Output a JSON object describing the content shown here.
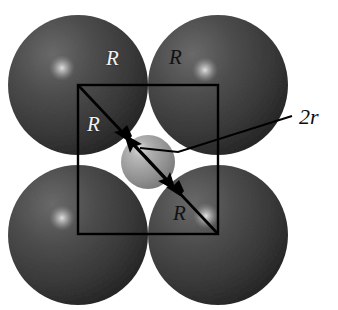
{
  "figure": {
    "type": "scientific-diagram",
    "canvas": {
      "width": 338,
      "height": 310,
      "background": "#ffffff"
    }
  },
  "colors": {
    "large_sphere_base": "#4a4a4a",
    "large_sphere_dark": "#2a2a2a",
    "large_sphere_highlight": "#d8d8d8",
    "small_sphere_base": "#9d9d9d",
    "small_sphere_dark": "#7a7a7a",
    "small_sphere_highlight": "#dcdcdc",
    "line": "#000000",
    "label_light": "#f2f2f2",
    "label_dark": "#121212",
    "background": "#ffffff"
  },
  "spheres": {
    "large": [
      {
        "name": "sphere-top-left",
        "cx": 78,
        "cy": 85,
        "r": 70,
        "hx": 62,
        "hy": 68,
        "hr": 13
      },
      {
        "name": "sphere-top-right",
        "cx": 218,
        "cy": 85,
        "r": 70,
        "hx": 205,
        "hy": 70,
        "hr": 13
      },
      {
        "name": "sphere-bottom-left",
        "cx": 78,
        "cy": 235,
        "r": 70,
        "hx": 62,
        "hy": 218,
        "hr": 13
      },
      {
        "name": "sphere-bottom-right",
        "cx": 218,
        "cy": 235,
        "r": 70,
        "hx": 206,
        "hy": 216,
        "hr": 13
      }
    ],
    "small": {
      "name": "sphere-center-interstitial",
      "cx": 148,
      "cy": 162,
      "r": 27,
      "hx": 140,
      "hy": 149,
      "hr": 10
    }
  },
  "square": {
    "x": 78,
    "y": 85,
    "width": 140,
    "height": 149
  },
  "diagonal": {
    "x1": 78,
    "y1": 85,
    "x2": 218,
    "y2": 234
  },
  "leader_2r": {
    "x1": 292,
    "y1": 116,
    "x2": 178,
    "y2": 152
  },
  "labels": {
    "radius_symbol": "R",
    "diameter_symbol": "2r",
    "items": [
      {
        "name": "label-R-top-left",
        "text": "R",
        "x": 106,
        "y": 48,
        "tone": "light"
      },
      {
        "name": "label-R-top-right",
        "text": "R",
        "x": 169,
        "y": 47,
        "tone": "dark"
      },
      {
        "name": "label-R-mid-left",
        "text": "R",
        "x": 87,
        "y": 114,
        "tone": "light"
      },
      {
        "name": "label-R-bottom-right",
        "text": "R",
        "x": 173,
        "y": 203,
        "tone": "dark"
      },
      {
        "name": "label-2r",
        "text": "2r",
        "x": 299,
        "y": 106,
        "tone": "dark"
      }
    ]
  }
}
